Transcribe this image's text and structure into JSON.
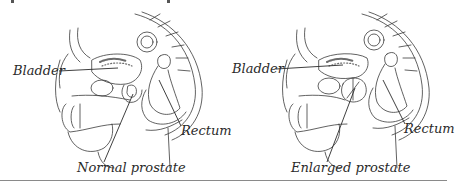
{
  "figure": {
    "panels": [
      {
        "id": "normal",
        "labels": {
          "bladder": "Bladder",
          "rectum": "Rectum",
          "prostate": "Normal prostate"
        }
      },
      {
        "id": "enlarged",
        "labels": {
          "bladder": "Bladder",
          "rectum": "Rectum",
          "prostate": "Enlarged prostate"
        }
      }
    ],
    "colors": {
      "line": "#3a3a3a",
      "shading": "#6b6b6b",
      "divider": "#8a8a8a",
      "background": "#ffffff"
    }
  }
}
